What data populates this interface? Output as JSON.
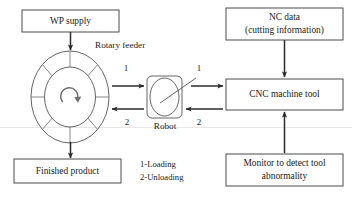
{
  "diagram": {
    "colors": {
      "box_stroke": "#4a4a4a",
      "connector": "#2b2b2b",
      "shape_stroke": "#555555",
      "text": "#1a1a1a",
      "background": "#ffffff"
    },
    "boxes": {
      "wp_supply": {
        "label": "WP supply"
      },
      "nc_data": {
        "line1": "NC data",
        "line2": "(cutting information)"
      },
      "cnc_machine": {
        "label": "CNC machine tool"
      },
      "monitor": {
        "line1": "Monitor to detect tool",
        "line2": "abnormality"
      },
      "finished_product": {
        "label": "Finished product"
      }
    },
    "shapes": {
      "rotary_feeder": {
        "label": "Rotary feeder",
        "segments": 8
      },
      "robot": {
        "label": "Robot"
      }
    },
    "flow_numbers": {
      "feeder_to_robot": "1",
      "robot_to_feeder": "2",
      "robot_to_cnc": "1",
      "cnc_to_robot": "2"
    },
    "legend": {
      "line1": "1-Loading",
      "line2": "2-Unloading"
    }
  }
}
